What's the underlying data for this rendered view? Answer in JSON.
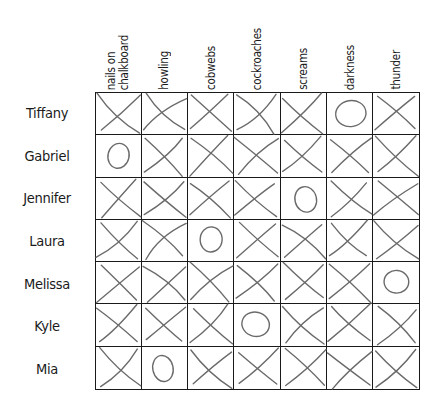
{
  "puzzle": {
    "columns": [
      {
        "label": "nails on\nchalkboard"
      },
      {
        "label": "howling"
      },
      {
        "label": "cobwebs"
      },
      {
        "label": "cockroaches"
      },
      {
        "label": "screams"
      },
      {
        "label": "darkness"
      },
      {
        "label": "thunder"
      }
    ],
    "rows": [
      {
        "name": "Tiffany",
        "marks": [
          "X",
          "X",
          "X",
          "X",
          "X",
          "O",
          "X"
        ]
      },
      {
        "name": "Gabriel",
        "marks": [
          "O",
          "X",
          "X",
          "X",
          "X",
          "X",
          "X"
        ]
      },
      {
        "name": "Jennifer",
        "marks": [
          "X",
          "X",
          "X",
          "X",
          "O",
          "X",
          "X"
        ]
      },
      {
        "name": "Laura",
        "marks": [
          "X",
          "X",
          "O",
          "X",
          "X",
          "X",
          "X"
        ]
      },
      {
        "name": "Melissa",
        "marks": [
          "X",
          "X",
          "X",
          "X",
          "X",
          "X",
          "O"
        ]
      },
      {
        "name": "Kyle",
        "marks": [
          "X",
          "X",
          "X",
          "O",
          "X",
          "X",
          "X"
        ]
      },
      {
        "name": "Mia",
        "marks": [
          "X",
          "O",
          "X",
          "X",
          "X",
          "X",
          "X"
        ]
      }
    ],
    "mark_legend": {
      "X": "cross-mark",
      "O": "circle-mark"
    },
    "colors": {
      "grid_line": "#1a1a1a",
      "pencil_mark": "#6a6a6a",
      "text": "#1a1a1a",
      "background": "#ffffff"
    }
  }
}
